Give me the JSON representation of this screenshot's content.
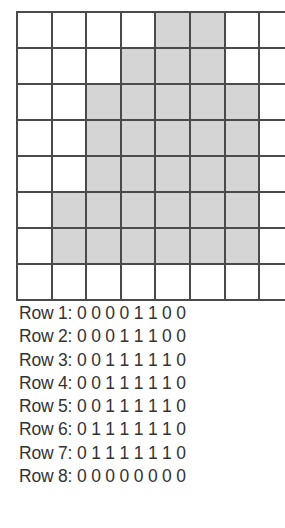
{
  "grid": {
    "rows": 8,
    "cols": 8,
    "fill_color": "#d5d5d5",
    "line_color": "#4a4a4a",
    "cells": [
      [
        0,
        0,
        0,
        0,
        1,
        1,
        0,
        0
      ],
      [
        0,
        0,
        0,
        1,
        1,
        1,
        0,
        0
      ],
      [
        0,
        0,
        1,
        1,
        1,
        1,
        1,
        0
      ],
      [
        0,
        0,
        1,
        1,
        1,
        1,
        1,
        0
      ],
      [
        0,
        0,
        1,
        1,
        1,
        1,
        1,
        0
      ],
      [
        0,
        1,
        1,
        1,
        1,
        1,
        1,
        0
      ],
      [
        0,
        1,
        1,
        1,
        1,
        1,
        1,
        0
      ],
      [
        0,
        0,
        0,
        0,
        0,
        0,
        0,
        0
      ]
    ]
  },
  "rows_text": [
    {
      "label": "Row 1:",
      "values": "0 0 0 0 1 1 0 0"
    },
    {
      "label": "Row 2:",
      "values": "0 0 0 1 1 1 0 0"
    },
    {
      "label": "Row 3:",
      "values": "0 0 1 1 1 1 1 0"
    },
    {
      "label": "Row 4:",
      "values": "0 0 1 1 1 1 1 0"
    },
    {
      "label": "Row 5:",
      "values": "0 0 1 1 1 1 1 0"
    },
    {
      "label": "Row 6:",
      "values": "0 1 1 1 1 1 1 0"
    },
    {
      "label": "Row 7:",
      "values": "0 1 1 1 1 1 1 0"
    },
    {
      "label": "Row 8:",
      "values": "0 0 0 0 0 0 0 0"
    }
  ]
}
